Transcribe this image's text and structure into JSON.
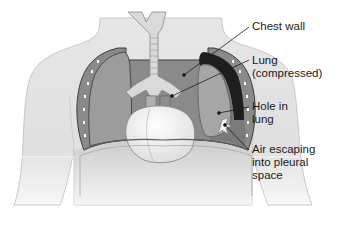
{
  "figure": {
    "style": "grayscale",
    "colors": {
      "background": "#ffffff",
      "skin": "#e4e4e4",
      "skin_outline": "#b8b8b8",
      "lung": "#9a9a9a",
      "lung_outline": "#4a4a4a",
      "compressed_lung": "#a8a8a8",
      "air_space": "#1e1e1e",
      "pleural_space": "#787878",
      "heart": "#f2f2f2",
      "trachea": "#d8d8d8",
      "diaphragm": "#c8c8c8",
      "leader_line": "#1a1a1a",
      "text": "#1a1a1a"
    }
  },
  "labels": [
    {
      "id": "chest-wall",
      "lines": [
        "Chest wall"
      ]
    },
    {
      "id": "lung-compressed",
      "lines": [
        "Lung",
        "(compressed)"
      ]
    },
    {
      "id": "hole-in-lung",
      "lines": [
        "Hole in",
        "lung"
      ]
    },
    {
      "id": "air-escaping",
      "lines": [
        "Air escaping",
        "into pleural",
        "space"
      ]
    }
  ]
}
